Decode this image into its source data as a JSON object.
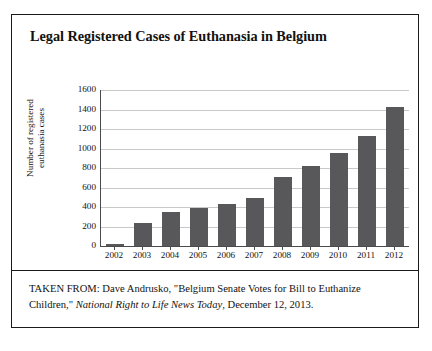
{
  "figure": {
    "title": "Legal Registered Cases of Euthanasia in Belgium",
    "caption_line1_prefix": "TAKEN FROM: Dave Andrusko, \"Belgium Senate Votes for Bill to",
    "caption_line2_prefix": "Euthanize Children,\" ",
    "caption_source_title": "National Right to Life News Today",
    "caption_line2_suffix": ",",
    "caption_line3": "December 12, 2013."
  },
  "chart_data": {
    "type": "bar",
    "title": "Legal Registered Cases of Euthanasia in Belgium",
    "xlabel": "",
    "ylabel": "Number of registered euthanasia cases",
    "ylabel_line1": "Number of registered",
    "ylabel_line2": "euthanasia cases",
    "categories": [
      "2002",
      "2003",
      "2004",
      "2005",
      "2006",
      "2007",
      "2008",
      "2009",
      "2010",
      "2011",
      "2012"
    ],
    "values": [
      25,
      235,
      350,
      395,
      430,
      495,
      705,
      820,
      950,
      1130,
      1430
    ],
    "ylim": [
      0,
      1600
    ],
    "yticks": [
      0,
      200,
      400,
      600,
      800,
      1000,
      1200,
      1400,
      1600
    ],
    "ytick_labels": [
      "0",
      "200",
      "400",
      "600",
      "800",
      "1000",
      "1200",
      "1400",
      "1600"
    ],
    "grid": true,
    "legend": false,
    "bar_color": "#58585a",
    "gridline_color": "#c9c9c9",
    "axis_color": "#4a4a4a"
  }
}
